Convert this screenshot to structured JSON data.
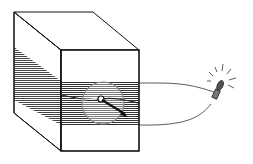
{
  "diagram": {
    "colors": {
      "stroke": "#111111",
      "hatch": "#444444",
      "circle": "#777777",
      "bulb": "#555555",
      "background": "#ffffff"
    },
    "elements": [
      {
        "name": "layered-block",
        "type": "cuboid"
      },
      {
        "name": "hatched-layer",
        "type": "striped band"
      },
      {
        "name": "magnifier-circle",
        "type": "circle"
      },
      {
        "name": "probe-needle",
        "type": "arrow"
      },
      {
        "name": "wire-top",
        "type": "curve"
      },
      {
        "name": "wire-bottom",
        "type": "curve"
      },
      {
        "name": "light-bulb",
        "type": "lamp with rays"
      }
    ]
  }
}
